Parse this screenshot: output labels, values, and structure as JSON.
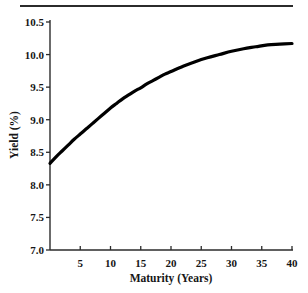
{
  "figure": {
    "has_top_rule": true,
    "background_color": "#ffffff",
    "ink_color": "#161616"
  },
  "chart_data": {
    "type": "line",
    "title": "",
    "subtitle": "",
    "xlabel": "Maturity (Years)",
    "ylabel": "Yield (%)",
    "xlim": [
      0,
      40
    ],
    "ylim": [
      7.0,
      10.5
    ],
    "grid": false,
    "legend": "none",
    "line_color": "#000000",
    "line_width": 3.2,
    "x_ticks": [
      5,
      10,
      15,
      20,
      25,
      30,
      35,
      40
    ],
    "x_tick_labels": [
      "5",
      "10",
      "15",
      "20",
      "25",
      "30",
      "35",
      "40"
    ],
    "y_ticks": [
      7.0,
      7.5,
      8.0,
      8.5,
      9.0,
      9.5,
      10.0,
      10.5
    ],
    "y_tick_labels": [
      "7.0",
      "7.5",
      "8.0",
      "8.5",
      "9.0",
      "9.5",
      "10.0",
      "10.5"
    ],
    "series": [
      {
        "name": "Yield curve",
        "x": [
          0,
          1,
          2,
          3,
          4,
          5,
          6,
          7,
          8,
          9,
          10,
          11,
          12,
          13,
          14,
          15,
          16,
          17,
          18,
          19,
          20,
          22,
          24,
          26,
          28,
          30,
          32,
          34,
          36,
          38,
          40
        ],
        "values": [
          8.33,
          8.43,
          8.52,
          8.61,
          8.7,
          8.78,
          8.86,
          8.94,
          9.02,
          9.1,
          9.18,
          9.25,
          9.32,
          9.38,
          9.44,
          9.49,
          9.55,
          9.6,
          9.65,
          9.7,
          9.74,
          9.82,
          9.89,
          9.95,
          10.0,
          10.05,
          10.09,
          10.12,
          10.15,
          10.16,
          10.17
        ]
      }
    ]
  }
}
